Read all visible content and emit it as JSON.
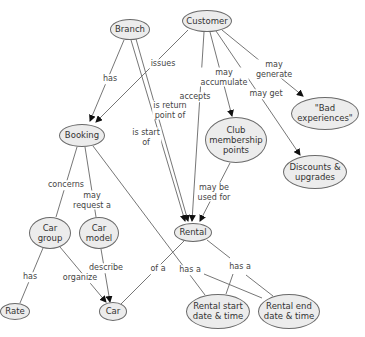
{
  "diagram": {
    "type": "concept-map",
    "colors": {
      "node_fill": "#ececec",
      "node_border": "#6a6a6a",
      "line": "#666666",
      "text": "#333333",
      "background": "#ffffff"
    },
    "nodes": [
      {
        "id": "branch",
        "label": "Branch",
        "cx": 130,
        "cy": 29,
        "w": 40,
        "h": 21
      },
      {
        "id": "customer",
        "label": "Customer",
        "cx": 207,
        "cy": 21,
        "w": 50,
        "h": 22
      },
      {
        "id": "booking",
        "label": "Booking",
        "cx": 82,
        "cy": 135,
        "w": 46,
        "h": 23
      },
      {
        "id": "club",
        "label": "Club\nmembership\npoints",
        "cx": 236,
        "cy": 140,
        "w": 62,
        "h": 46
      },
      {
        "id": "bad",
        "label": "\"Bad\nexperiences\"",
        "cx": 325,
        "cy": 113,
        "w": 68,
        "h": 33
      },
      {
        "id": "discounts",
        "label": "Discounts &\nupgrades",
        "cx": 315,
        "cy": 172,
        "w": 64,
        "h": 34
      },
      {
        "id": "cargroup",
        "label": "Car\ngroup",
        "cx": 50,
        "cy": 233,
        "w": 42,
        "h": 32
      },
      {
        "id": "carmodel",
        "label": "Car\nmodel",
        "cx": 99,
        "cy": 233,
        "w": 40,
        "h": 32
      },
      {
        "id": "rental",
        "label": "Rental",
        "cx": 193,
        "cy": 232,
        "w": 38,
        "h": 19
      },
      {
        "id": "rate",
        "label": "Rate",
        "cx": 15,
        "cy": 311,
        "w": 30,
        "h": 17
      },
      {
        "id": "car",
        "label": "Car",
        "cx": 113,
        "cy": 311,
        "w": 28,
        "h": 19
      },
      {
        "id": "rstart",
        "label": "Rental start\ndate & time",
        "cx": 218,
        "cy": 311,
        "w": 64,
        "h": 35
      },
      {
        "id": "rend",
        "label": "Rental end\ndate & time",
        "cx": 289,
        "cy": 311,
        "w": 62,
        "h": 35
      }
    ],
    "links": [
      {
        "label": "has",
        "lx": 110,
        "ly": 79
      },
      {
        "label": "issues",
        "lx": 163,
        "ly": 64
      },
      {
        "label": "is return\npoint of",
        "lx": 170,
        "ly": 110
      },
      {
        "label": "accepts",
        "lx": 195,
        "ly": 97
      },
      {
        "label": "is start\nof",
        "lx": 146,
        "ly": 137
      },
      {
        "label": "may\naccumulate",
        "lx": 224,
        "ly": 77
      },
      {
        "label": "may get",
        "lx": 266,
        "ly": 94
      },
      {
        "label": "may\ngenerate",
        "lx": 274,
        "ly": 69
      },
      {
        "label": "concerns",
        "lx": 66,
        "ly": 185
      },
      {
        "label": "may\nrequest a",
        "lx": 92,
        "ly": 200
      },
      {
        "label": "may be\nused for",
        "lx": 214,
        "ly": 192
      },
      {
        "label": "has",
        "lx": 30,
        "ly": 277
      },
      {
        "label": "organize",
        "lx": 80,
        "ly": 278
      },
      {
        "label": "describe",
        "lx": 106,
        "ly": 268
      },
      {
        "label": "of a",
        "lx": 158,
        "ly": 269
      },
      {
        "label": "has a",
        "lx": 190,
        "ly": 270
      },
      {
        "label": "has a",
        "lx": 240,
        "ly": 267
      }
    ]
  }
}
